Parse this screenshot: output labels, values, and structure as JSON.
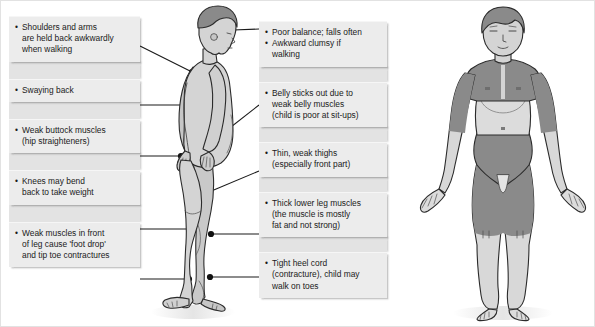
{
  "diagram": {
    "background_color": "#ffffff",
    "callout_fill": "#ececec",
    "callout_gap_fill": "#e3e3e3",
    "leader_line_color": "#1a1a1a",
    "body_light_color": "#d4d4d4",
    "body_dark_color": "#8a8a8a",
    "outline_color": "#2b2b2b"
  },
  "left_column": {
    "items": [
      {
        "id": "shoulders-arms",
        "bullets": [
          "Shoulders and arms\nare held back awkwardly\nwhen walking"
        ]
      },
      {
        "id": "swaying-back",
        "bullets": [
          "Swaying back"
        ]
      },
      {
        "id": "weak-buttock-muscles",
        "bullets": [
          "Weak buttock muscles\n(hip straighteners)"
        ]
      },
      {
        "id": "knees-bend-back",
        "bullets": [
          "Knees may bend\nback to take weight"
        ]
      },
      {
        "id": "weak-front-leg-muscles",
        "bullets": [
          "Weak muscles in front\nof leg cause 'foot drop'\nand tip toe contractures"
        ]
      }
    ]
  },
  "right_column": {
    "items": [
      {
        "id": "poor-balance",
        "bullets": [
          "Poor balance; falls often",
          "Awkward clumsy if\nwalking"
        ]
      },
      {
        "id": "belly-sticks-out",
        "bullets": [
          "Belly sticks out due to\nweak belly muscles\n(child is poor at sit-ups)"
        ]
      },
      {
        "id": "thin-weak-thighs",
        "bullets": [
          "Thin, weak thighs\n(especially front part)"
        ]
      },
      {
        "id": "thick-lower-leg-muscles",
        "bullets": [
          "Thick lower leg muscles\n(the muscle is mostly\nfat and not strong)"
        ]
      },
      {
        "id": "tight-heel-cord",
        "bullets": [
          "Tight heel cord\n(contracture), child may\nwalk on toes"
        ]
      }
    ]
  },
  "figures": [
    {
      "id": "side-view-figure",
      "view": "side profile standing child",
      "bullet_marker_count": 8
    },
    {
      "id": "front-view-figure",
      "view": "front facing child with shaded affected muscle groups",
      "shaded_regions": [
        "shoulders",
        "chest",
        "upper arms",
        "hips",
        "thighs"
      ]
    }
  ]
}
